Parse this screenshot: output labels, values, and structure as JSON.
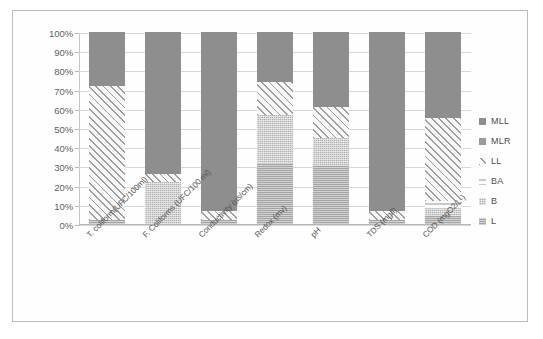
{
  "chart_data": {
    "type": "bar",
    "subtype": "stacked-100-percent",
    "title": "",
    "xlabel": "",
    "ylabel": "",
    "ylim": [
      0,
      100
    ],
    "ytick_labels": [
      "100%",
      "90%",
      "80%",
      "70%",
      "60%",
      "50%",
      "40%",
      "30%",
      "20%",
      "10%",
      "0%"
    ],
    "ytick_values": [
      100,
      90,
      80,
      70,
      60,
      50,
      40,
      30,
      20,
      10,
      0
    ],
    "grid": true,
    "legend_position": "right",
    "legend_order_top_to_bottom": [
      "MLL",
      "MLR",
      "LL",
      "BA",
      "B",
      "L"
    ],
    "stack_order_bottom_to_top": [
      "L",
      "B",
      "BA",
      "LL",
      "MLR",
      "MLL"
    ],
    "categories": [
      "T. coliform(UFC/100ml)",
      "F. Coliforms (UFC/100 ml)",
      "Conductivity (µs/cm)",
      "Redox (mv)",
      "pH",
      "TDS (mg/l)",
      "COD (mgO2/L-)"
    ],
    "series": [
      {
        "name": "L",
        "color": "#a4a4a4",
        "pattern": "fine-horizontal",
        "values": [
          2,
          0,
          2,
          32,
          30,
          2,
          4
        ]
      },
      {
        "name": "B",
        "color": "#b0b0b0",
        "pattern": "crosshatch-fine",
        "values": [
          0,
          22,
          0,
          25,
          15,
          0,
          4
        ]
      },
      {
        "name": "BA",
        "color": "#c9c9c9",
        "pattern": "horizontal-lines",
        "values": [
          0,
          0,
          0,
          0,
          0,
          0,
          4
        ]
      },
      {
        "name": "LL",
        "color": "#9d9d9d",
        "pattern": "diagonal-hatch",
        "values": [
          70,
          4,
          5,
          17,
          16,
          5,
          43
        ]
      },
      {
        "name": "MLR",
        "color": "#9a9a9a",
        "pattern": "solid",
        "values": [
          0,
          0,
          0,
          0,
          0,
          0,
          0
        ]
      },
      {
        "name": "MLL",
        "color": "#8e8e8e",
        "pattern": "solid",
        "values": [
          28,
          74,
          93,
          26,
          39,
          93,
          45
        ]
      }
    ]
  },
  "legend": {
    "items": [
      {
        "label": "MLL",
        "swatch": "f-MLL"
      },
      {
        "label": "MLR",
        "swatch": "f-MLR"
      },
      {
        "label": "LL",
        "swatch": "f-LL"
      },
      {
        "label": "BA",
        "swatch": "f-BA"
      },
      {
        "label": "B",
        "swatch": "f-B"
      },
      {
        "label": "L",
        "swatch": "f-L"
      }
    ]
  }
}
